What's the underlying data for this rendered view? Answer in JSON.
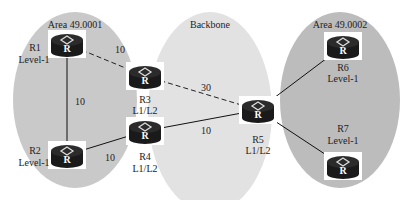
{
  "areas": [
    {
      "id": "area1",
      "label": "Area 49.0001",
      "cx": 75,
      "cy": 100,
      "rx": 62,
      "ry": 88,
      "fill": "#c9c9c9"
    },
    {
      "id": "backbone",
      "label": "Backbone",
      "cx": 210,
      "cy": 112,
      "rx": 62,
      "ry": 100,
      "fill": "#e0e0e0"
    },
    {
      "id": "area2",
      "label": "Area 49.0002",
      "cx": 340,
      "cy": 100,
      "rx": 60,
      "ry": 88,
      "fill": "#bdbdbd"
    }
  ],
  "routers": [
    {
      "id": "R1",
      "name": "R1",
      "level": "Level-1",
      "x": 67,
      "y": 44
    },
    {
      "id": "R2",
      "name": "R2",
      "level": "Level-1",
      "x": 67,
      "y": 155
    },
    {
      "id": "R3",
      "name": "R3",
      "level": "L1/L2",
      "x": 145,
      "y": 76
    },
    {
      "id": "R4",
      "name": "R4",
      "level": "L1/L2",
      "x": 145,
      "y": 131
    },
    {
      "id": "R5",
      "name": "R5",
      "level": "L1/L2",
      "x": 258,
      "y": 110
    },
    {
      "id": "R6",
      "name": "R6",
      "level": "Level-1",
      "x": 343,
      "y": 46
    },
    {
      "id": "R7",
      "name": "R7",
      "level": "Level-1",
      "x": 343,
      "y": 166
    }
  ],
  "router_glyph": "R",
  "links": [
    {
      "from": "R1",
      "to": "R3",
      "cost": "10",
      "style": "dashed",
      "lx": 120,
      "ly": 50
    },
    {
      "from": "R3",
      "to": "R5",
      "cost": "30",
      "style": "dashed",
      "lx": 203,
      "ly": 88
    },
    {
      "from": "R1",
      "to": "R2",
      "cost": "10",
      "style": "solid",
      "lx": 78,
      "ly": 102
    },
    {
      "from": "R2",
      "to": "R4",
      "cost": "10",
      "style": "solid",
      "lx": 110,
      "ly": 158
    },
    {
      "from": "R4",
      "to": "R5",
      "cost": "10",
      "style": "solid",
      "lx": 203,
      "ly": 131
    },
    {
      "from": "R5",
      "to": "R6",
      "cost": "",
      "style": "solid"
    },
    {
      "from": "R5",
      "to": "R7",
      "cost": "",
      "style": "solid"
    }
  ],
  "labels": {
    "area1": "Area 49.0001",
    "backbone": "Backbone",
    "area2": "Area 49.0002",
    "R1_name": "R1",
    "R1_level": "Level-1",
    "R2_name": "R2",
    "R2_level": "Level-1",
    "R3_name": "R3",
    "R3_level": "L1/L2",
    "R4_name": "R4",
    "R4_level": "L1/L2",
    "R5_name": "R5",
    "R5_level": "L1/L2",
    "R6_name": "R6",
    "R6_level": "Level-1",
    "R7_name": "R7",
    "R7_level": "Level-1",
    "cost_r1_r3": "10",
    "cost_r3_r5": "30",
    "cost_r1_r2": "10",
    "cost_r2_r4": "10",
    "cost_r4_r5": "10"
  }
}
